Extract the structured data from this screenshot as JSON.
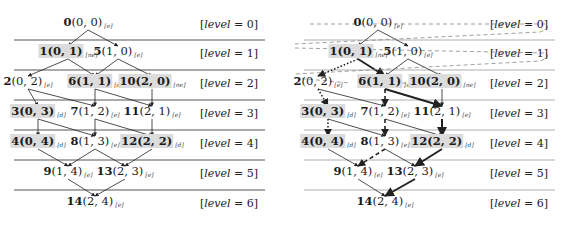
{
  "levels": [
    {
      "label_prefix": "[",
      "label_var": "level",
      "label_suffix": " = 0]"
    },
    {
      "label_prefix": "[",
      "label_var": "level",
      "label_suffix": " = 1]"
    },
    {
      "label_prefix": "[",
      "label_var": "level",
      "label_suffix": " = 2]"
    },
    {
      "label_prefix": "[",
      "label_var": "level",
      "label_suffix": " = 3]"
    },
    {
      "label_prefix": "[",
      "label_var": "level",
      "label_suffix": " = 4]"
    },
    {
      "label_prefix": "[",
      "label_var": "level",
      "label_suffix": " = 5]"
    },
    {
      "label_prefix": "[",
      "label_var": "level",
      "label_suffix": " = 6]"
    }
  ],
  "nodes": [
    {
      "id": "0",
      "coord": "(0, 0)",
      "sub": "[e]",
      "highlight": false
    },
    {
      "id": "1",
      "coord": "(0, 1)",
      "sub": "[ne]",
      "highlight": true
    },
    {
      "id": "5",
      "coord": "(1, 0)",
      "sub": "[e]",
      "highlight": false
    },
    {
      "id": "2",
      "coord": "(0, 2)",
      "sub": "[e]",
      "highlight": false
    },
    {
      "id": "6",
      "coord": "(1, 1)",
      "sub": "[d]",
      "highlight": true
    },
    {
      "id": "10",
      "coord": "(2, 0)",
      "sub": "[ne]",
      "highlight": true
    },
    {
      "id": "3",
      "coord": "(0, 3)",
      "sub": "[d]",
      "highlight": true
    },
    {
      "id": "7",
      "coord": "(1, 2)",
      "sub": "[e]",
      "highlight": false
    },
    {
      "id": "11",
      "coord": "(2, 1)",
      "sub": "[e]",
      "highlight": false
    },
    {
      "id": "4",
      "coord": "(0, 4)",
      "sub": "[d]",
      "highlight": true
    },
    {
      "id": "8",
      "coord": "(1, 3)",
      "sub": "[e]",
      "highlight": false
    },
    {
      "id": "12",
      "coord": "(2, 2)",
      "sub": "[d]",
      "highlight": true
    },
    {
      "id": "9",
      "coord": "(1, 4)",
      "sub": "[e]",
      "highlight": false
    },
    {
      "id": "13",
      "coord": "(2, 3)",
      "sub": "[e]",
      "highlight": false
    },
    {
      "id": "14",
      "coord": "(2, 4)",
      "sub": "[e]",
      "highlight": false
    }
  ],
  "edges": [
    [
      "0",
      "1"
    ],
    [
      "0",
      "5"
    ],
    [
      "1",
      "2"
    ],
    [
      "1",
      "6"
    ],
    [
      "5",
      "6"
    ],
    [
      "5",
      "10"
    ],
    [
      "2",
      "3"
    ],
    [
      "2",
      "7"
    ],
    [
      "6",
      "7"
    ],
    [
      "6",
      "11"
    ],
    [
      "10",
      "11"
    ],
    [
      "3",
      "4"
    ],
    [
      "3",
      "8"
    ],
    [
      "7",
      "8"
    ],
    [
      "7",
      "12"
    ],
    [
      "11",
      "12"
    ],
    [
      "4",
      "9"
    ],
    [
      "8",
      "9"
    ],
    [
      "8",
      "13"
    ],
    [
      "12",
      "13"
    ],
    [
      "9",
      "14"
    ],
    [
      "13",
      "14"
    ]
  ],
  "right_panel_edge_styles": {
    "thick": [
      [
        "1",
        "6"
      ],
      [
        "6",
        "11"
      ],
      [
        "11",
        "12"
      ],
      [
        "12",
        "13"
      ],
      [
        "13",
        "14"
      ]
    ],
    "dotted": [
      [
        "1",
        "2"
      ],
      [
        "2",
        "3"
      ],
      [
        "3",
        "4"
      ]
    ],
    "dashed": [
      [
        "6",
        "7"
      ],
      [
        "7",
        "8"
      ],
      [
        "8",
        "9"
      ]
    ]
  },
  "colors": {
    "highlight_bg": "#dcdcdc",
    "line": "#555555",
    "dashed_order": "#888888"
  }
}
